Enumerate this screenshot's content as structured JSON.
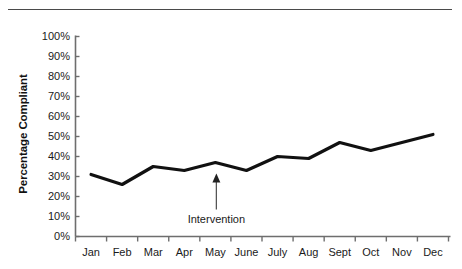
{
  "figure": {
    "has_top_rule": true,
    "background_color": "#ffffff",
    "line_color": "#111111",
    "axis_color": "#6e6e6e",
    "text_color": "#1a1a1a"
  },
  "chart_data": {
    "type": "line",
    "title": "",
    "xlabel": "",
    "ylabel": "Percentage Compliant",
    "categories": [
      "Jan",
      "Feb",
      "Mar",
      "Apr",
      "May",
      "June",
      "July",
      "Aug",
      "Sept",
      "Oct",
      "Nov",
      "Dec"
    ],
    "values": [
      31,
      26,
      35,
      33,
      37,
      33,
      40,
      39,
      47,
      43,
      47,
      51
    ],
    "series": [
      {
        "name": "Percentage Compliant",
        "values": [
          31,
          26,
          35,
          33,
          37,
          33,
          40,
          39,
          47,
          43,
          47,
          51
        ]
      }
    ],
    "ylim": [
      0,
      100
    ],
    "ytick_values": [
      0,
      10,
      20,
      30,
      40,
      50,
      60,
      70,
      80,
      90,
      100
    ],
    "ytick_labels": [
      "0%",
      "10%",
      "20%",
      "30%",
      "40%",
      "50%",
      "60%",
      "70%",
      "80%",
      "90%",
      "100%"
    ],
    "grid": false,
    "legend": "none",
    "annotations": [
      {
        "text": "Intervention",
        "at_category": "May",
        "arrow": "up",
        "points_to_value": 37
      }
    ]
  }
}
